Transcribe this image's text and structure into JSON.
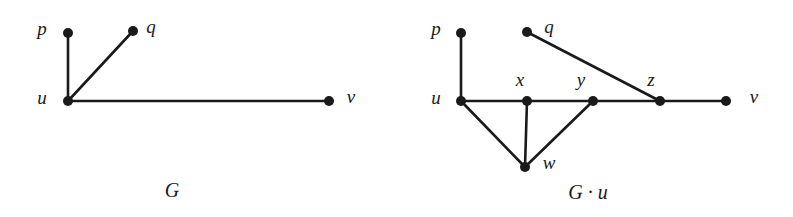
{
  "figure": {
    "background_color": "#ffffff",
    "ink_color": "#1a1a1a",
    "width": 793,
    "height": 217
  },
  "graphs": [
    {
      "id": "graph-G",
      "caption": "G",
      "caption_pos": {
        "x": 172,
        "y": 190
      },
      "vertices": [
        {
          "id": "p",
          "label": "p",
          "x": 68,
          "y": 33,
          "label_x": 42,
          "label_y": 28
        },
        {
          "id": "q",
          "label": "q",
          "x": 133,
          "y": 31,
          "label_x": 151,
          "label_y": 26
        },
        {
          "id": "u",
          "label": "u",
          "x": 68,
          "y": 101,
          "label_x": 42,
          "label_y": 97
        },
        {
          "id": "v",
          "label": "v",
          "x": 329,
          "y": 101,
          "label_x": 351,
          "label_y": 96
        }
      ],
      "edges": [
        {
          "from": "u",
          "to": "p"
        },
        {
          "from": "u",
          "to": "q"
        },
        {
          "from": "u",
          "to": "v"
        }
      ]
    },
    {
      "id": "graph-G-contract-u",
      "caption": "G · u",
      "caption_pos": {
        "x": 588,
        "y": 192
      },
      "vertices": [
        {
          "id": "p",
          "label": "p",
          "x": 461,
          "y": 33,
          "label_x": 436,
          "label_y": 28
        },
        {
          "id": "q",
          "label": "q",
          "x": 527,
          "y": 32,
          "label_x": 549,
          "label_y": 26
        },
        {
          "id": "u",
          "label": "u",
          "x": 461,
          "y": 101,
          "label_x": 436,
          "label_y": 97
        },
        {
          "id": "x",
          "label": "x",
          "x": 527,
          "y": 101,
          "label_x": 520,
          "label_y": 79
        },
        {
          "id": "y",
          "label": "y",
          "x": 593,
          "y": 101,
          "label_x": 581,
          "label_y": 79
        },
        {
          "id": "z",
          "label": "z",
          "x": 660,
          "y": 101,
          "label_x": 651,
          "label_y": 79
        },
        {
          "id": "v",
          "label": "v",
          "x": 726,
          "y": 101,
          "label_x": 754,
          "label_y": 96
        },
        {
          "id": "w",
          "label": "w",
          "x": 525,
          "y": 167,
          "label_x": 549,
          "label_y": 162
        }
      ],
      "edges": [
        {
          "from": "u",
          "to": "p"
        },
        {
          "from": "u",
          "to": "x"
        },
        {
          "from": "x",
          "to": "y"
        },
        {
          "from": "y",
          "to": "z"
        },
        {
          "from": "z",
          "to": "v"
        },
        {
          "from": "q",
          "to": "z"
        },
        {
          "from": "u",
          "to": "w"
        },
        {
          "from": "x",
          "to": "w"
        },
        {
          "from": "y",
          "to": "w"
        }
      ]
    }
  ],
  "style": {
    "vertex_radius": 5,
    "edge_width": 2.6
  }
}
